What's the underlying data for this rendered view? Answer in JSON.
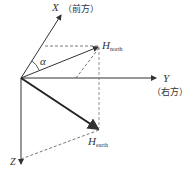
{
  "diagram": {
    "axes": {
      "x": {
        "label": "X",
        "note": "（前方）"
      },
      "y": {
        "label": "Y",
        "note": "（右方）"
      },
      "z": {
        "label": "Z"
      }
    },
    "angle": {
      "label": "α"
    },
    "vectors": {
      "north": {
        "label": "H",
        "sub": "north"
      },
      "earth": {
        "label": "H",
        "sub": "earth"
      }
    },
    "colors": {
      "line": "#333333",
      "dashed": "#555555"
    }
  }
}
